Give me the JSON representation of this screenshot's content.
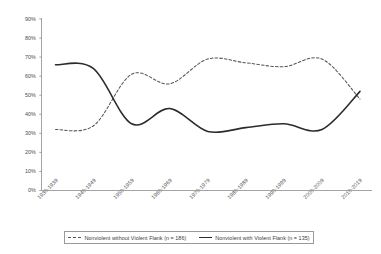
{
  "chart_data": {
    "type": "line",
    "title": "",
    "xlabel": "",
    "ylabel": "",
    "ylim": [
      0,
      90
    ],
    "grid": false,
    "legend_position": "bottom",
    "categories": [
      "1930-1939",
      "1940-1949",
      "1950-1959",
      "1960-1969",
      "1970-1979",
      "1980-1989",
      "1990-1999",
      "2000-2009",
      "2010-2019"
    ],
    "ytick_labels": [
      "0%",
      "10%",
      "20%",
      "30%",
      "40%",
      "50%",
      "60%",
      "70%",
      "80%",
      "90%"
    ],
    "ytick_values": [
      0,
      10,
      20,
      30,
      40,
      50,
      60,
      70,
      80,
      90
    ],
    "series": [
      {
        "name": "Nonviolent without Violent Flank (n = 186)",
        "style": "dashed",
        "color": "#555555",
        "values": [
          32,
          34,
          61,
          56,
          69,
          67,
          65,
          69,
          48
        ]
      },
      {
        "name": "Nonviolent with Violent Flank (n = 135)",
        "style": "solid",
        "color": "#2b2b2b",
        "values": [
          66,
          64,
          35,
          43,
          31,
          33,
          35,
          32,
          52
        ]
      }
    ]
  },
  "legend": {
    "entries": [
      {
        "label": "Nonviolent without Violent Flank (n = 186)",
        "style": "dashed"
      },
      {
        "label": "Nonviolent with Violent Flank (n = 135)",
        "style": "solid"
      }
    ]
  }
}
